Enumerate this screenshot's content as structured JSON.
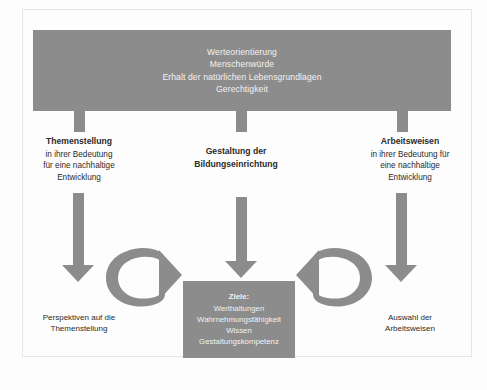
{
  "diagram": {
    "title_bar": {
      "name": "values-bar",
      "lines": [
        "Werteorientierung",
        "Menschenwürde",
        "Erhalt der natürlichen Lebensgrundlagen",
        "Gerechtigkeit"
      ]
    },
    "pillars": [
      {
        "id": "themenstellung",
        "head": "Themenstellung",
        "sub": [
          "in ihrer Bedeutung",
          "für eine nachhaltige",
          "Entwicklung"
        ]
      },
      {
        "id": "gestaltung",
        "head": "Gestaltung der",
        "head2": "Bildungseinrichtung",
        "sub": []
      },
      {
        "id": "arbeitsweisen",
        "head": "Arbeitsweisen",
        "sub": [
          "in ihrer Bedeutung für",
          "eine nachhaltige",
          "Entwicklung"
        ]
      }
    ],
    "goals_box": {
      "head": "Ziele:",
      "items": [
        "Werthaltungen",
        "Wahrnehmungsfähigkeit",
        "Wissen",
        "Gestaltungskompetenz"
      ]
    },
    "bottom_captions": [
      {
        "id": "perspektiven",
        "lines": [
          "Perspektiven auf die",
          "Themenstellung"
        ]
      },
      {
        "id": "auswahl",
        "lines": [
          "Auswahl der",
          "Arbeitsweisen"
        ]
      }
    ],
    "arrows": {
      "down_left": "down-arrow-themenstellung",
      "down_mid": "down-arrow-gestaltung",
      "down_right": "down-arrow-arbeitsweisen",
      "curve_left": "curved-arrow-right-pointing",
      "curve_right": "curved-arrow-left-pointing"
    },
    "colors": {
      "fill_gray": "#8c8c8c",
      "text_on_gray": "#f2f2f2",
      "text_dark": "#2b2b2b",
      "background": "#fdfdfd"
    }
  }
}
